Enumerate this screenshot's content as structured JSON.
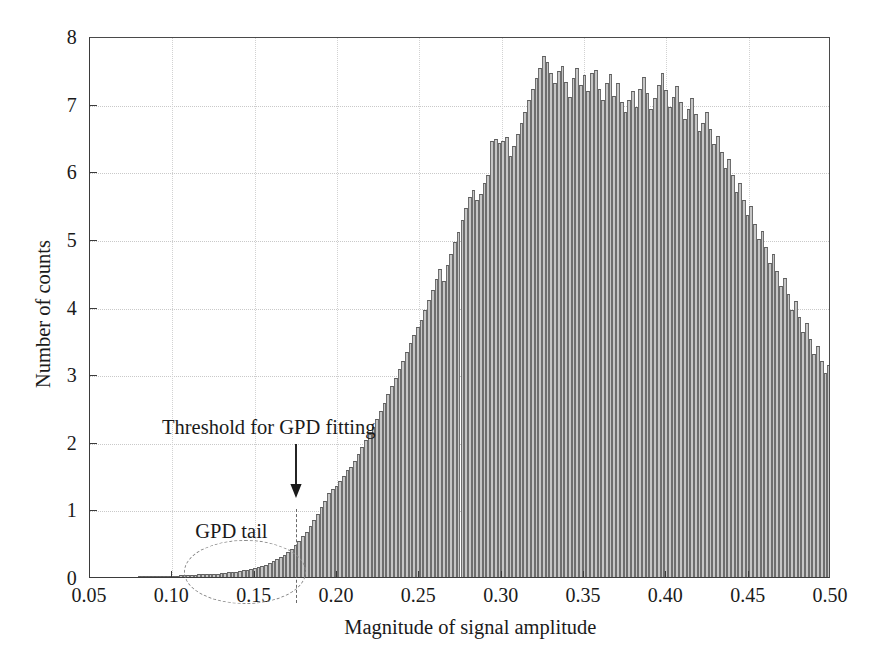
{
  "chart_data": {
    "type": "bar",
    "title": "",
    "subtitle": "",
    "xlabel": "Magnitude of signal amplitude",
    "ylabel": "Number of counts",
    "xlim": [
      0.05,
      0.5
    ],
    "ylim": [
      0,
      8
    ],
    "xticks": [
      "0.05",
      "0.10",
      "0.15",
      "0.20",
      "0.25",
      "0.30",
      "0.35",
      "0.40",
      "0.45",
      "0.50"
    ],
    "xtick_values": [
      0.05,
      0.1,
      0.15,
      0.2,
      0.25,
      0.3,
      0.35,
      0.4,
      0.45,
      0.5
    ],
    "yticks": [
      "0",
      "1",
      "2",
      "3",
      "4",
      "5",
      "6",
      "7",
      "8"
    ],
    "ytick_values": [
      0,
      1,
      2,
      3,
      4,
      5,
      6,
      7,
      8
    ],
    "grid": true,
    "grid_style": "dotted",
    "legend": false,
    "bar_fill_color": "#c6c6c6",
    "bar_edge_color": "#6e6e6e",
    "bin_width": 0.00225,
    "x_start": 0.05,
    "values": [
      0.0,
      0.0,
      0.0,
      0.0,
      0.0,
      0.0,
      0.0,
      0.0,
      0.0,
      0.0,
      0.0,
      0.0,
      0.0,
      0.01,
      0.01,
      0.01,
      0.01,
      0.01,
      0.02,
      0.02,
      0.02,
      0.02,
      0.02,
      0.02,
      0.03,
      0.03,
      0.03,
      0.03,
      0.03,
      0.04,
      0.04,
      0.04,
      0.04,
      0.05,
      0.05,
      0.06,
      0.06,
      0.07,
      0.07,
      0.08,
      0.09,
      0.1,
      0.11,
      0.12,
      0.13,
      0.15,
      0.17,
      0.18,
      0.2,
      0.23,
      0.26,
      0.29,
      0.33,
      0.37,
      0.42,
      0.47,
      0.53,
      0.6,
      0.67,
      0.75,
      0.84,
      0.93,
      1.03,
      1.13,
      1.24,
      1.3,
      1.34,
      1.42,
      1.5,
      1.58,
      1.62,
      1.72,
      1.82,
      1.92,
      2.02,
      2.12,
      2.22,
      2.34,
      2.46,
      2.58,
      2.7,
      2.82,
      2.95,
      3.08,
      3.2,
      3.33,
      3.46,
      3.58,
      3.7,
      3.8,
      3.95,
      4.1,
      4.25,
      4.4,
      4.55,
      4.38,
      4.62,
      4.78,
      4.95,
      5.1,
      5.28,
      5.45,
      5.62,
      5.72,
      5.58,
      5.66,
      5.82,
      5.95,
      6.45,
      6.48,
      6.42,
      6.45,
      6.5,
      6.22,
      6.38,
      6.55,
      6.72,
      6.88,
      7.05,
      7.22,
      7.38,
      7.52,
      7.7,
      7.62,
      7.45,
      7.3,
      7.48,
      7.55,
      7.32,
      7.1,
      7.38,
      7.52,
      7.28,
      7.42,
      7.18,
      7.45,
      7.5,
      7.22,
      7.05,
      7.3,
      7.44,
      7.12,
      7.3,
      7.02,
      6.88,
      7.05,
      7.18,
      6.95,
      7.22,
      7.4,
      7.15,
      6.92,
      7.08,
      7.28,
      7.45,
      7.2,
      6.95,
      7.1,
      7.26,
      7.02,
      6.78,
      6.92,
      7.08,
      6.85,
      6.6,
      6.72,
      6.88,
      6.62,
      6.4,
      6.52,
      6.28,
      6.05,
      6.18,
      5.95,
      5.7,
      5.82,
      5.58,
      5.35,
      5.48,
      5.22,
      5.0,
      5.12,
      4.88,
      4.65,
      4.78,
      4.52,
      4.3,
      4.42,
      4.18,
      3.95,
      4.08,
      3.85,
      3.62,
      3.75,
      3.52,
      3.3,
      3.42,
      3.2,
      3.02,
      3.14,
      2.92,
      2.72,
      2.84,
      2.62,
      2.45,
      2.56,
      2.38,
      2.22,
      2.32,
      2.5,
      2.35,
      2.18,
      2.28,
      2.12,
      1.98,
      2.08,
      2.2,
      2.05,
      1.9,
      2.0,
      1.85,
      1.72,
      1.82,
      1.95,
      1.8,
      1.66,
      1.75,
      1.6,
      1.48,
      1.56,
      1.42,
      1.3,
      1.38,
      1.48,
      1.35,
      1.22,
      1.3,
      1.18,
      1.08,
      1.15,
      1.25,
      1.12,
      1.0,
      1.07,
      0.96,
      0.86,
      0.92,
      0.82,
      0.73,
      0.78,
      0.7,
      0.62,
      0.66,
      0.58,
      0.52,
      0.55,
      0.48,
      0.42,
      0.45,
      0.39,
      0.34,
      0.36,
      0.31,
      0.27,
      0.29,
      0.24,
      0.21,
      0.22,
      0.18,
      0.15,
      0.16,
      0.13,
      0.11,
      0.11,
      0.09,
      0.08,
      0.08,
      0.06,
      0.05,
      0.05,
      0.04,
      0.03,
      0.03,
      0.02,
      0.02,
      0.02,
      0.01,
      0.01,
      0.01,
      0.01,
      0.01,
      0.0,
      0.0,
      0.0,
      0.0,
      0.0,
      0.0,
      0.0,
      0.0,
      0.0,
      0.0,
      0.0,
      0.0,
      0.0
    ]
  },
  "annotations": {
    "threshold": {
      "label": "Threshold for GPD fitting",
      "x_value": 0.1755,
      "marker": "down-arrow"
    },
    "tail": {
      "label": "GPD tail",
      "shape": "dashed-ellipse"
    }
  }
}
